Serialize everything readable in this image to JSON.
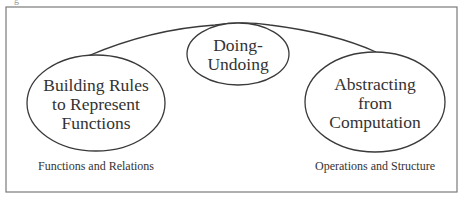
{
  "figure": {
    "top_clipped_text": "g",
    "frame": {
      "x": 6,
      "y": 7,
      "width": 451,
      "height": 185,
      "stroke": "#7a7a7a"
    },
    "line_color": "#3a3a3a",
    "nodes": [
      {
        "id": "building-rules",
        "lines": [
          "Building Rules",
          "to Represent",
          "Functions"
        ],
        "cx": 96,
        "cy": 103,
        "rx": 69,
        "ry": 48
      },
      {
        "id": "doing-undoing",
        "lines": [
          "Doing-",
          "Undoing"
        ],
        "cx": 238,
        "cy": 54,
        "rx": 51,
        "ry": 31
      },
      {
        "id": "abstracting",
        "lines": [
          "Abstracting",
          "from",
          "Computation"
        ],
        "cx": 375,
        "cy": 102,
        "rx": 70,
        "ry": 50
      }
    ],
    "captions": [
      {
        "id": "functions-relations",
        "text": "Functions and Relations",
        "x": 96,
        "y": 159
      },
      {
        "id": "operations-structure",
        "text": "Operations and Structure",
        "x": 375,
        "y": 159
      }
    ]
  }
}
